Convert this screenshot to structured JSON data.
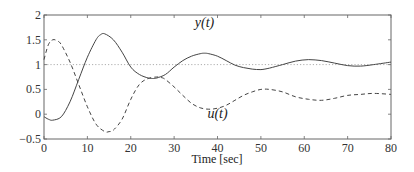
{
  "chart_data": {
    "type": "line",
    "title": "",
    "xlabel": "Time [sec]",
    "ylabel": "",
    "xlim": [
      0,
      80
    ],
    "ylim": [
      -0.5,
      2
    ],
    "xticks": [
      "0",
      "10",
      "20",
      "30",
      "40",
      "50",
      "60",
      "70",
      "80"
    ],
    "yticks": [
      "-0.5",
      "0",
      "0.5",
      "1",
      "1.5",
      "2"
    ],
    "grid": false,
    "reference_line": {
      "y": 1,
      "style": "dotted"
    },
    "series": [
      {
        "name": "y(t)",
        "style": "solid",
        "label_pos": {
          "t": 37,
          "v": 1.75
        },
        "x": [
          0,
          1,
          2,
          4,
          6,
          8,
          10,
          12,
          13,
          14,
          16,
          18,
          20,
          22,
          24,
          25,
          26,
          28,
          30,
          32,
          34,
          36,
          37,
          38,
          40,
          42,
          44,
          46,
          48,
          50,
          52,
          55,
          58,
          61,
          64,
          67,
          70,
          73,
          76,
          80
        ],
        "values": [
          -0.05,
          -0.1,
          -0.12,
          -0.05,
          0.25,
          0.7,
          1.15,
          1.5,
          1.6,
          1.62,
          1.5,
          1.25,
          0.95,
          0.8,
          0.73,
          0.72,
          0.73,
          0.8,
          0.95,
          1.08,
          1.17,
          1.22,
          1.23,
          1.22,
          1.17,
          1.08,
          0.99,
          0.94,
          0.91,
          0.9,
          0.93,
          1.0,
          1.07,
          1.1,
          1.08,
          1.03,
          0.98,
          0.97,
          1.0,
          1.05
        ]
      },
      {
        "name": "u(t)",
        "style": "dashed",
        "label_pos": {
          "t": 40,
          "v": -0.08
        },
        "x": [
          0,
          1,
          2,
          3,
          4,
          6,
          8,
          10,
          12,
          14,
          15,
          16,
          18,
          20,
          22,
          24,
          26,
          27,
          28,
          30,
          32,
          34,
          36,
          38,
          40,
          42,
          44,
          46,
          48,
          50,
          52,
          55,
          58,
          61,
          64,
          67,
          70,
          73,
          76,
          80
        ],
        "values": [
          1.1,
          1.4,
          1.5,
          1.48,
          1.4,
          1.05,
          0.6,
          0.15,
          -0.2,
          -0.35,
          -0.35,
          -0.32,
          -0.1,
          0.3,
          0.6,
          0.72,
          0.75,
          0.74,
          0.7,
          0.55,
          0.38,
          0.22,
          0.13,
          0.1,
          0.12,
          0.18,
          0.28,
          0.38,
          0.45,
          0.5,
          0.5,
          0.45,
          0.35,
          0.3,
          0.28,
          0.32,
          0.38,
          0.4,
          0.42,
          0.4
        ]
      }
    ]
  }
}
